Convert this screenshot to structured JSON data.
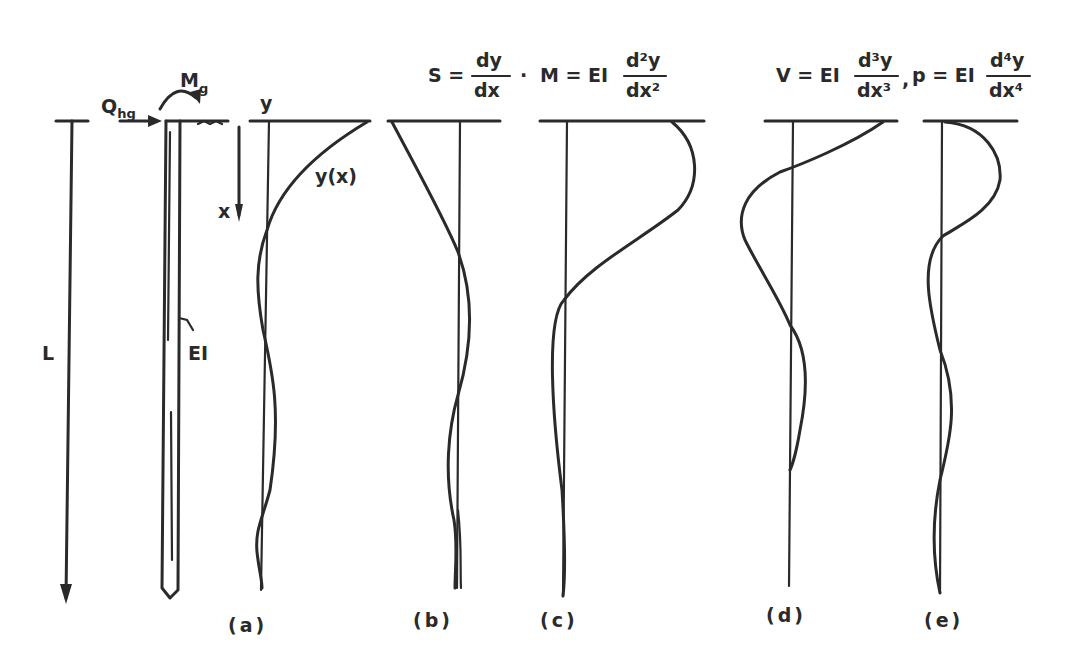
{
  "diagram": {
    "labels": {
      "length": "L",
      "lateral_load": "Q",
      "lateral_load_sub": "hg",
      "moment": "M",
      "moment_sub": "g",
      "stiffness": "EI",
      "depth_axis": "x",
      "deflection_axis": "y",
      "deflection_curve": "y(x)"
    },
    "equations": {
      "slope_lhs": "S =",
      "slope_num": "dy",
      "slope_den": "dx",
      "sep1": "·",
      "moment_lhs": "M = EI",
      "moment_num": "d²y",
      "moment_den": "dx²",
      "shear_lhs": "V = EI",
      "shear_num": "d³y",
      "shear_den": "dx³",
      "sep2": ",",
      "pressure_lhs": "p = EI",
      "pressure_num": "d⁴y",
      "pressure_den": "dx⁴"
    },
    "panels": [
      {
        "id": "a",
        "caption": "(a)",
        "quantity": "deflection y(x)"
      },
      {
        "id": "b",
        "caption": "(b)",
        "quantity": "slope S"
      },
      {
        "id": "c",
        "caption": "(c)",
        "quantity": "moment M"
      },
      {
        "id": "d",
        "caption": "(d)",
        "quantity": "shear V"
      },
      {
        "id": "e",
        "caption": "(e)",
        "quantity": "soil reaction p"
      }
    ]
  }
}
